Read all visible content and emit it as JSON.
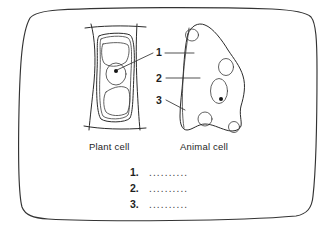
{
  "worksheet": {
    "frame_name": "rounded-border-frame",
    "background_color": "#ffffff",
    "ink_color": "#2b2b2b"
  },
  "diagrams": [
    {
      "id": "plant-cell",
      "caption": "Plant cell",
      "features": [
        "cell wall",
        "cell membrane",
        "vacuole",
        "nucleus",
        "nucleolus"
      ]
    },
    {
      "id": "animal-cell",
      "caption": "Animal cell",
      "features": [
        "cell membrane",
        "cytoplasm",
        "nucleus",
        "nucleolus",
        "vacuoles"
      ]
    }
  ],
  "callouts": [
    {
      "number": "1"
    },
    {
      "number": "2"
    },
    {
      "number": "3"
    }
  ],
  "answers": [
    {
      "number": "1.",
      "blank": ".........."
    },
    {
      "number": "2.",
      "blank": ".........."
    },
    {
      "number": "3.",
      "blank": ".........."
    }
  ]
}
